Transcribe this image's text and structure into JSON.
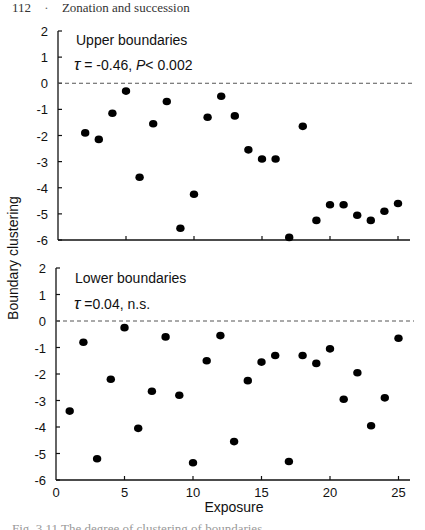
{
  "header": {
    "page_number": "112",
    "separator": "·",
    "running_title": "Zonation and succession"
  },
  "caption": {
    "text": "Fig. 3.11  The degree of clustering of boundaries..."
  },
  "chart_data": [
    {
      "type": "scatter",
      "panel": "upper",
      "title": "Upper boundaries",
      "annotation": "τ = -0.46, P < 0.002",
      "xlabel": "Exposure",
      "ylabel": "Boundary clustering",
      "xlim": [
        0,
        26
      ],
      "ylim": [
        -6,
        2
      ],
      "xticks": [
        0,
        5,
        10,
        15,
        20,
        25
      ],
      "yticks": [
        2,
        1,
        0,
        -1,
        -2,
        -3,
        -4,
        -5,
        -6
      ],
      "reference_line": {
        "y": 0,
        "style": "dashed"
      },
      "x": [
        2,
        3,
        4,
        5,
        6,
        7,
        8,
        9,
        10,
        11,
        12,
        13,
        14,
        15,
        16,
        17,
        18,
        19,
        20,
        21,
        22,
        23,
        24,
        25
      ],
      "y": [
        -1.9,
        -2.15,
        -1.15,
        -0.3,
        -3.6,
        -1.55,
        -0.7,
        -5.55,
        -4.25,
        -1.3,
        -0.5,
        -1.25,
        -2.55,
        -2.9,
        -2.9,
        -5.9,
        -1.65,
        -5.25,
        -4.65,
        -4.65,
        -5.05,
        -5.25,
        -4.9,
        -4.6
      ]
    },
    {
      "type": "scatter",
      "panel": "lower",
      "title": "Lower boundaries",
      "annotation": "τ = 0.04, n.s.",
      "xlabel": "Exposure",
      "ylabel": "Boundary clustering",
      "xlim": [
        0,
        26
      ],
      "ylim": [
        -6,
        2
      ],
      "xticks": [
        0,
        5,
        10,
        15,
        20,
        25
      ],
      "yticks": [
        2,
        1,
        0,
        -1,
        -2,
        -3,
        -4,
        -5,
        -6
      ],
      "reference_line": {
        "y": 0,
        "style": "dashed"
      },
      "x": [
        1,
        2,
        3,
        4,
        5,
        6,
        7,
        8,
        9,
        10,
        11,
        12,
        13,
        14,
        15,
        16,
        17,
        18,
        19,
        20,
        21,
        22,
        23,
        24,
        25
      ],
      "y": [
        -3.4,
        -0.8,
        -5.2,
        -2.2,
        -0.25,
        -4.05,
        -2.65,
        -0.6,
        -2.8,
        -5.35,
        -1.5,
        -0.55,
        -4.55,
        -2.25,
        -1.55,
        -1.3,
        -5.3,
        -1.3,
        -1.6,
        -1.05,
        -2.95,
        -1.95,
        -3.95,
        -2.9,
        -0.65
      ]
    }
  ],
  "shared": {
    "ylabel": "Boundary clustering",
    "xlabel": "Exposure"
  },
  "colors": {
    "ink": "#111111",
    "point": "#000000",
    "dashed": "#555555"
  }
}
